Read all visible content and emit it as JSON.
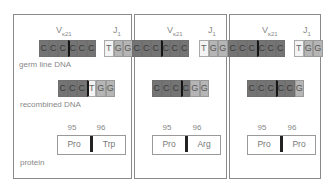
{
  "panels": [
    {
      "v_label": "Vκ21",
      "j_label": "J1",
      "germline_v": [
        "C",
        "C",
        "C",
        "C",
        "C",
        "C"
      ],
      "germline_j": [
        "T",
        "G",
        "G"
      ],
      "recombined": [
        "C",
        "C",
        "C",
        "T",
        "G",
        "G"
      ],
      "positions": [
        "95",
        "96"
      ],
      "protein": [
        "Pro",
        "Trp"
      ]
    },
    {
      "v_label": "Vκ21",
      "j_label": "J1",
      "germline_v": [
        "C",
        "C",
        "C",
        "C",
        "C",
        "C"
      ],
      "germline_j": [
        "T",
        "G",
        "G"
      ],
      "recombined": [
        "C",
        "C",
        "C",
        "C",
        "G",
        "G"
      ],
      "positions": [
        "95",
        "96"
      ],
      "protein": [
        "Pro",
        "Arg"
      ]
    },
    {
      "v_label": "Vκ21",
      "j_label": "J1",
      "germline_v": [
        "C",
        "C",
        "C",
        "C",
        "C",
        "C"
      ],
      "germline_j": [
        "T",
        "G",
        "G"
      ],
      "recombined": [
        "C",
        "C",
        "C",
        "C",
        "C",
        "G"
      ],
      "positions": [
        "95",
        "96"
      ],
      "protein": [
        "Pro",
        "Pro"
      ]
    }
  ],
  "row_labels": {
    "germline": "germ line DNA",
    "recombined": "recombined DNA",
    "protein": "protein"
  },
  "gene": {
    "v_main": "V",
    "v_sub": "κ21",
    "j_main": "J",
    "j_sub": "1"
  }
}
